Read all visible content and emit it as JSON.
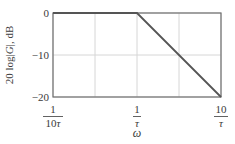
{
  "chart_data": {
    "type": "line",
    "title": "",
    "xlabel": "ω",
    "ylabel_parts": [
      "20 log|",
      "G",
      "|, dB"
    ],
    "ylabel": "20 log|G|, dB",
    "x_scale": "log",
    "x_ticks": [
      {
        "num": "1",
        "den": "10τ",
        "value": 0.1
      },
      {
        "num": "1",
        "den": "τ",
        "value": 1
      },
      {
        "num": "10",
        "den": "τ",
        "value": 10
      }
    ],
    "y_ticks": [
      0,
      -10,
      -20
    ],
    "ylim": [
      -20,
      0
    ],
    "xlim_decades": [
      0.1,
      10
    ],
    "grid": true,
    "grid_x_positions_decades": [
      -1,
      -0.5,
      0,
      0.5,
      1
    ],
    "grid_y_values": [
      0,
      -10,
      -20
    ],
    "series": [
      {
        "name": "asymptotic magnitude",
        "x": [
          0.1,
          1,
          10
        ],
        "x_labels": [
          "1/(10τ)",
          "1/τ",
          "10/τ"
        ],
        "values": [
          0,
          0,
          -20
        ],
        "color": "#555555"
      }
    ],
    "legend": null
  },
  "colors": {
    "frame": "#707070",
    "grid": "#d6d6d6",
    "line": "#555555",
    "text": "#3a3a3a"
  }
}
